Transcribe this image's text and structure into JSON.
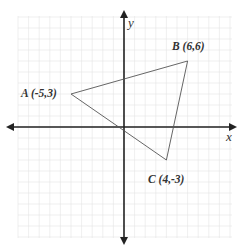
{
  "diagram": {
    "type": "coordinate-plane",
    "axes": {
      "x_label": "x",
      "y_label": "y"
    },
    "grid": {
      "on": true,
      "x_range": [
        -10,
        10
      ],
      "y_range": [
        -10,
        10
      ]
    },
    "triangle": {
      "vertices": [
        {
          "name": "A",
          "x": -5,
          "y": 3,
          "label": "A (-5,3)"
        },
        {
          "name": "B",
          "x": 6,
          "y": 6,
          "label": "B (6,6)"
        },
        {
          "name": "C",
          "x": 4,
          "y": -3,
          "label": "C (4,-3)"
        }
      ]
    },
    "colors": {
      "axis": "#222222",
      "grid": "#e4e4e4",
      "triangle": "#555555",
      "label": "#333333"
    }
  }
}
